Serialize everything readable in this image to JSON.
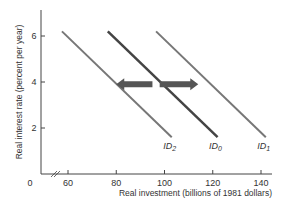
{
  "chart_data": {
    "type": "line",
    "title": "",
    "xlabel": "Real investment (billions of 1981 dollars)",
    "ylabel": "Real interest rate (percent per year)",
    "xlim": [
      50,
      145
    ],
    "ylim": [
      0,
      7
    ],
    "x_axis_break": true,
    "origin_label": "0",
    "x_ticks": [
      60,
      80,
      100,
      120,
      140
    ],
    "y_ticks": [
      2,
      4,
      6
    ],
    "grid": false,
    "legend": "none",
    "series": [
      {
        "name": "ID2",
        "label_main": "ID",
        "label_sub": "2",
        "x": [
          57.5,
          103
        ],
        "y": [
          6.2,
          1.6
        ],
        "color": "#777777",
        "width": 2
      },
      {
        "name": "ID0",
        "label_main": "ID",
        "label_sub": "0",
        "x": [
          76.5,
          122
        ],
        "y": [
          6.2,
          1.6
        ],
        "color": "#444444",
        "width": 2.5
      },
      {
        "name": "ID1",
        "label_main": "ID",
        "label_sub": "1",
        "x": [
          96.5,
          142
        ],
        "y": [
          6.2,
          1.6
        ],
        "color": "#777777",
        "width": 2
      }
    ],
    "annotations": [
      {
        "type": "arrow",
        "direction": "left",
        "from_x": 95,
        "to_x": 80,
        "y": 3.9,
        "color": "#555555"
      },
      {
        "type": "arrow",
        "direction": "right",
        "from_x": 98,
        "to_x": 114,
        "y": 3.9,
        "color": "#555555"
      }
    ]
  }
}
